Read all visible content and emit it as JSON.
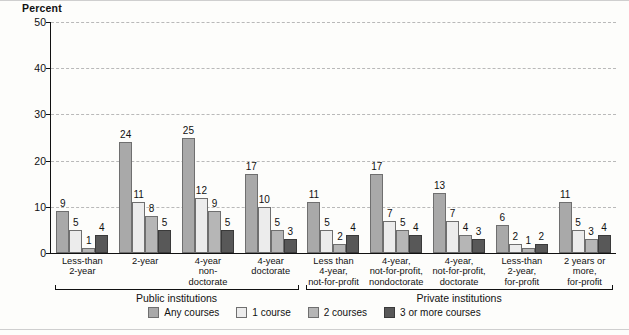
{
  "chart_data": {
    "type": "bar",
    "title": "",
    "ylabel": "Percent",
    "xlabel": "",
    "ylim": [
      0,
      50
    ],
    "yticks": [
      0,
      10,
      20,
      30,
      40,
      50
    ],
    "grid": true,
    "legend_position": "bottom",
    "categories": [
      "Less-than 2-year",
      "2-year",
      "4-year non-doctorate",
      "4-year doctorate",
      "Less than 4-year, not-for-profit",
      "4-year, not-for-profit, nondoctorate",
      "4-year, not-for-profit, doctorate",
      "Less-than 2-year, for-profit",
      "2 years or more, for-profit"
    ],
    "category_lines": [
      [
        "Less-than",
        "2-year"
      ],
      [
        "2-year"
      ],
      [
        "4-year",
        "non-",
        "doctorate"
      ],
      [
        "4-year",
        "doctorate"
      ],
      [
        "Less than",
        "4-year,",
        "not-for-profit"
      ],
      [
        "4-year,",
        "not-for-profit,",
        "nondoctorate"
      ],
      [
        "4-year,",
        "not-for-profit,",
        "doctorate"
      ],
      [
        "Less-than",
        "2-year,",
        "for-profit"
      ],
      [
        "2 years or",
        "more,",
        "for-profit"
      ]
    ],
    "series": [
      {
        "name": "Any courses",
        "color": "#a9a9a9",
        "values": [
          9,
          24,
          25,
          17,
          11,
          17,
          13,
          6,
          11
        ]
      },
      {
        "name": "1 course",
        "color": "#ececec",
        "values": [
          5,
          11,
          12,
          10,
          5,
          7,
          7,
          2,
          5
        ]
      },
      {
        "name": "2 courses",
        "color": "#b6b6b6",
        "values": [
          1,
          8,
          9,
          5,
          2,
          5,
          4,
          1,
          3
        ]
      },
      {
        "name": "3 or more courses",
        "color": "#585858",
        "values": [
          4,
          5,
          5,
          3,
          4,
          4,
          3,
          2,
          4
        ]
      }
    ],
    "group_brackets": [
      {
        "label": "Public institutions",
        "start_index": 0,
        "end_index": 3
      },
      {
        "label": "Private institutions",
        "start_index": 4,
        "end_index": 8
      }
    ]
  }
}
